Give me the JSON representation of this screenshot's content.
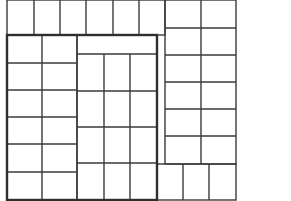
{
  "diagram": {
    "title": "",
    "colors": {
      "background": "#ffffff",
      "line": "#3a3a3a"
    },
    "regions": [
      {
        "name": "top-band",
        "x": 7,
        "y": 0,
        "w": 158,
        "h": 35,
        "cols": [
          34,
          60,
          86,
          113,
          139
        ],
        "rows": []
      },
      {
        "name": "right-column",
        "x": 165,
        "y": 0,
        "w": 71,
        "h": 164,
        "cols": [
          201
        ],
        "rows": [
          28,
          55,
          82,
          109,
          136
        ]
      },
      {
        "name": "left-column",
        "x": 7,
        "y": 35,
        "w": 70,
        "h": 165,
        "cols": [
          42
        ],
        "rows": [
          63,
          90,
          117,
          144,
          172
        ]
      },
      {
        "name": "middle-block",
        "x": 77,
        "y": 35,
        "w": 80,
        "h": 165,
        "strip": 54,
        "cols": [
          104,
          130
        ],
        "rows": [
          91,
          127,
          163
        ]
      },
      {
        "name": "bottom-right",
        "x": 157,
        "y": 164,
        "w": 79,
        "h": 36,
        "cols": [
          183,
          209
        ],
        "rows": []
      }
    ],
    "frame": {
      "x": 7,
      "y": 35,
      "w": 150,
      "h": 165
    }
  }
}
